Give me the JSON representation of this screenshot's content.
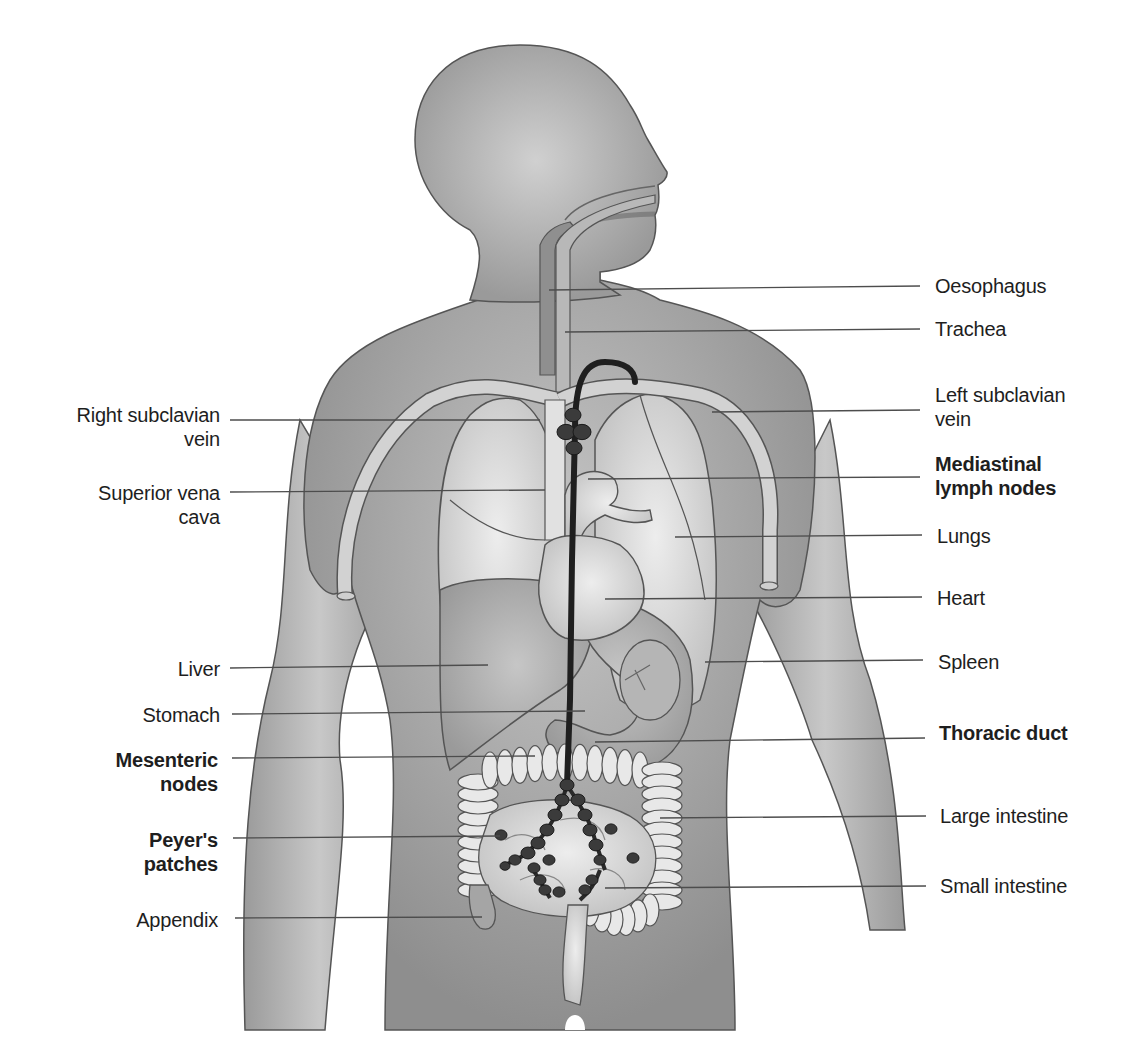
{
  "diagram": {
    "colors": {
      "background": "#ffffff",
      "body": "#9c9c9c",
      "body_light": "#c4c4c4",
      "organ": "#d6d6d6",
      "organ_light": "#e9e9e9",
      "outline": "#4a4a4a",
      "lymph": "#2a2a2a",
      "leader": "#4d4d4d",
      "text": "#1e1e1e"
    },
    "labels_left": [
      {
        "id": "right-subclavian-vein",
        "text": "Right subclavian\nvein",
        "bold": false
      },
      {
        "id": "superior-vena-cava",
        "text": "Superior vena\ncava",
        "bold": false
      },
      {
        "id": "liver",
        "text": "Liver",
        "bold": false
      },
      {
        "id": "stomach",
        "text": "Stomach",
        "bold": false
      },
      {
        "id": "mesenteric-nodes",
        "text": "Mesenteric\nnodes",
        "bold": true
      },
      {
        "id": "peyers-patches",
        "text": "Peyer's\npatches",
        "bold": true
      },
      {
        "id": "appendix",
        "text": "Appendix",
        "bold": false
      }
    ],
    "labels_right": [
      {
        "id": "oesophagus",
        "text": "Oesophagus",
        "bold": false
      },
      {
        "id": "trachea",
        "text": "Trachea",
        "bold": false
      },
      {
        "id": "left-subclavian-vein",
        "text": "Left subclavian\nvein",
        "bold": false
      },
      {
        "id": "mediastinal-lymph-nodes",
        "text": "Mediastinal\nlymph nodes",
        "bold": true
      },
      {
        "id": "lungs",
        "text": "Lungs",
        "bold": false
      },
      {
        "id": "heart",
        "text": "Heart",
        "bold": false
      },
      {
        "id": "spleen",
        "text": "Spleen",
        "bold": false
      },
      {
        "id": "thoracic-duct",
        "text": "Thoracic duct",
        "bold": true
      },
      {
        "id": "large-intestine",
        "text": "Large intestine",
        "bold": false
      },
      {
        "id": "small-intestine",
        "text": "Small intestine",
        "bold": false
      }
    ]
  }
}
